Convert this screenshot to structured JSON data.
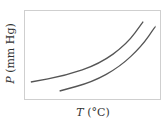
{
  "chart_data": {
    "type": "line",
    "title": "",
    "xlabel": "T (°C)",
    "ylabel": "P (mm Hg)",
    "xlabel_var": "T",
    "xlabel_unit": " (°C)",
    "ylabel_var": "P",
    "ylabel_unit": " (mm Hg)",
    "grid": false,
    "ticks": false,
    "legend": null,
    "series": [
      {
        "name": "curve-upper",
        "points": [
          [
            0.05,
            0.2
          ],
          [
            0.3,
            0.27
          ],
          [
            0.55,
            0.4
          ],
          [
            0.75,
            0.62
          ],
          [
            0.87,
            0.87
          ]
        ],
        "color": "#555555"
      },
      {
        "name": "curve-lower",
        "points": [
          [
            0.26,
            0.1
          ],
          [
            0.5,
            0.2
          ],
          [
            0.7,
            0.37
          ],
          [
            0.86,
            0.6
          ],
          [
            0.96,
            0.82
          ]
        ],
        "color": "#555555"
      }
    ]
  },
  "axes_box": {
    "left": 24,
    "top": 10,
    "right": 161,
    "bottom": 100,
    "color": "#cccccc"
  }
}
